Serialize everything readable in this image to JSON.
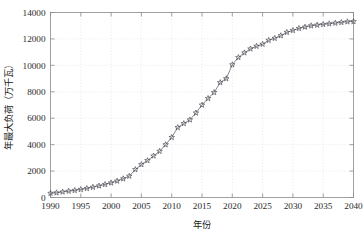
{
  "chart_data": {
    "type": "scatter",
    "title": "",
    "xlabel": "年份",
    "ylabel": "年最大负荷（万千瓦）",
    "xlim": [
      1990,
      2040
    ],
    "ylim": [
      0,
      14000
    ],
    "xticks": [
      1990,
      1995,
      2000,
      2005,
      2010,
      2015,
      2020,
      2025,
      2030,
      2035,
      2040
    ],
    "yticks": [
      0,
      2000,
      4000,
      6000,
      8000,
      10000,
      12000,
      14000
    ],
    "xtick_labels": [
      "1990",
      "1995",
      "2000",
      "2005",
      "2010",
      "2015",
      "2020",
      "2025",
      "2030",
      "2035",
      "2040"
    ],
    "ytick_labels": [
      "0",
      "2000",
      "4000",
      "6000",
      "8000",
      "10000",
      "12000",
      "14000"
    ],
    "grid": true,
    "legend": "none",
    "marker": "star-5",
    "series": [
      {
        "name": "年最大负荷",
        "x": [
          1990,
          1991,
          1992,
          1993,
          1994,
          1995,
          1996,
          1997,
          1998,
          1999,
          2000,
          2001,
          2002,
          2003,
          2004,
          2005,
          2006,
          2007,
          2008,
          2009,
          2010,
          2011,
          2012,
          2013,
          2014,
          2015,
          2016,
          2017,
          2018,
          2019,
          2020,
          2021,
          2022,
          2023,
          2024,
          2025,
          2026,
          2027,
          2028,
          2029,
          2030,
          2031,
          2032,
          2033,
          2034,
          2035,
          2036,
          2037,
          2038,
          2039,
          2040
        ],
        "values": [
          320,
          360,
          420,
          480,
          540,
          610,
          690,
          780,
          880,
          990,
          1110,
          1250,
          1420,
          1620,
          2120,
          2500,
          2800,
          3150,
          3500,
          4000,
          4550,
          5300,
          5600,
          5880,
          6400,
          7000,
          7500,
          7950,
          8700,
          9000,
          10050,
          10600,
          10950,
          11250,
          11450,
          11600,
          11900,
          12050,
          12250,
          12500,
          12650,
          12800,
          12900,
          13000,
          13050,
          13100,
          13150,
          13200,
          13250,
          13300,
          13320
        ]
      }
    ]
  },
  "figure": {
    "background_color": "#ffffff",
    "axis_color": "#8a8a8a",
    "grid_color": "#d8d8dc",
    "marker_color": "#3a3a46",
    "line_color": "#555560"
  }
}
